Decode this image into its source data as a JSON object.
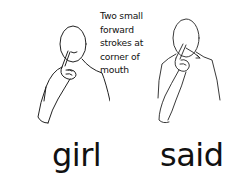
{
  "signs": [
    {
      "word": "girl",
      "illustration": "person-pointing-index-finger-to-cheek-corner-of-mouth"
    },
    {
      "word": "said",
      "illustration": "person-pointing-index-finger-to-mouth-with-forward-motion-arrow"
    }
  ],
  "caption": {
    "lines": [
      "Two small",
      "forward",
      "strokes at",
      "corner of",
      "mouth"
    ]
  },
  "colors": {
    "line": "#222222",
    "background": "#ffffff",
    "text": "#111111"
  }
}
